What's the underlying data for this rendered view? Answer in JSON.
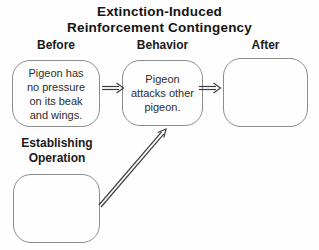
{
  "title": {
    "line1": "Extinction-Induced",
    "line2": "Reinforcement Contingency"
  },
  "headers": {
    "before": "Before",
    "behavior": "Behavior",
    "after": "After"
  },
  "boxes": {
    "before": "Pigeon has\nno pressure\non its beak\nand wings.",
    "behavior": "Pigeon\nattacks other\npigeon.",
    "after": "",
    "establishing_operation": ""
  },
  "establishing_operation_label": {
    "line1": "Establishing",
    "line2": "Operation"
  },
  "connections": [
    {
      "from": "before-box",
      "to": "behavior-box",
      "style": "double-line-arrow"
    },
    {
      "from": "behavior-box",
      "to": "after-box",
      "style": "double-line-arrow"
    },
    {
      "from": "establishing-operation-box",
      "to": "behavior-box",
      "style": "double-line-arrow"
    }
  ],
  "colors": {
    "background": "#fefefe",
    "title_text": "#141414",
    "body_text": "#2d2d2d",
    "box_border": "#8c8c8c",
    "arrow": "#3d3d3d"
  }
}
